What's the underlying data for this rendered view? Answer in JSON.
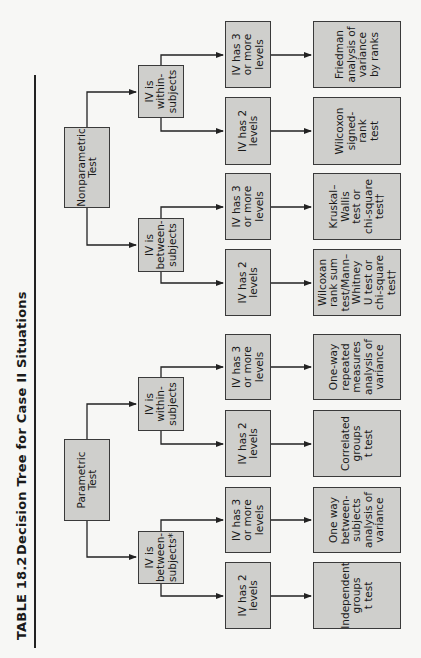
{
  "header": {
    "table_number": "TABLE 18.2",
    "title": "Decision Tree for Case II Situations"
  },
  "tree": {
    "parametric": {
      "label": "Parametric\nTest",
      "between": {
        "label": "IV is\nbetween-\nsubjects*",
        "two_levels": {
          "label": "IV has 2\nlevels",
          "test": "Independent\ngroups\nt test"
        },
        "three_levels": {
          "label": "IV has 3\nor more\nlevels",
          "test": "One way\nbetween-\nsubjects\nanalysis of\nvariance"
        }
      },
      "within": {
        "label": "IV is\nwithin-\nsubjects",
        "two_levels": {
          "label": "IV has 2\nlevels",
          "test": "Correlated\ngroups\nt test"
        },
        "three_levels": {
          "label": "IV has 3\nor more\nlevels",
          "test": "One-way\nrepeated\nmeasures\nanalysis of\nvariance"
        }
      }
    },
    "nonparametric": {
      "label": "Nonparametric\nTest",
      "between": {
        "label": "IV is\nbetween-\nsubjects",
        "two_levels": {
          "label": "IV has 2\nlevels",
          "test": "Wilcoxan\nrank sum\ntest/Mann–\nWhitney\nU test or\nchi-square\ntest†"
        },
        "three_levels": {
          "label": "IV has 3\nor more\nlevels",
          "test": "Kruskal–\nWallis\ntest or\nchi-square\ntest†"
        }
      },
      "within": {
        "label": "IV is\nwithin-\nsubjects",
        "two_levels": {
          "label": "IV has 2\nlevels",
          "test": "Wilcoxon\nsigned-rank\ntest"
        },
        "three_levels": {
          "label": "IV has 3\nor more\nlevels",
          "test": "Friedman\nanalysis of\nvariance\nby ranks"
        }
      }
    }
  },
  "colors": {
    "box_fill": "#cfcfcc",
    "box_border": "#3a3a3a",
    "line": "#222222",
    "page": "#f7f7f5"
  }
}
